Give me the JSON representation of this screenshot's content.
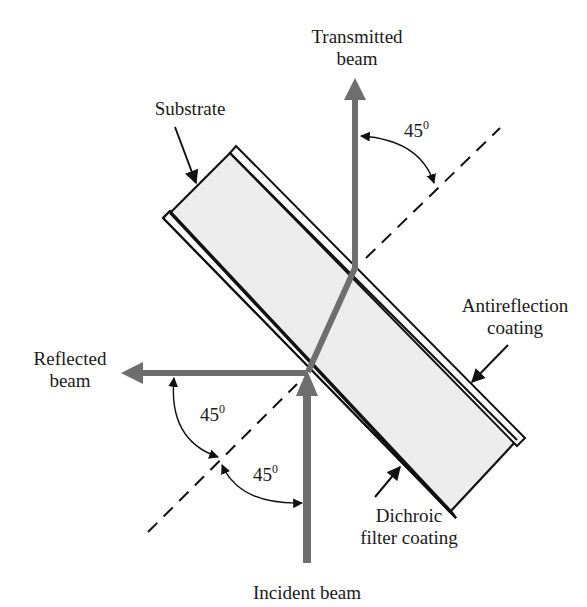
{
  "diagram": {
    "type": "optics-schematic",
    "colors": {
      "beam": "#6e6e6e",
      "substrate_fill": "#ececec",
      "outline": "#111111",
      "text": "#1a1a1a"
    },
    "labels": {
      "transmitted_line1": "Transmitted",
      "transmitted_line2": "beam",
      "substrate": "Substrate",
      "reflected_line1": "Reflected",
      "reflected_line2": "beam",
      "antireflection_line1": "Antireflection",
      "antireflection_line2": "coating",
      "dichroic_line1": "Dichroic",
      "dichroic_line2": "filter coating",
      "incident": "Incident beam"
    },
    "angles": {
      "transmitted_to_normal": "45",
      "reflected_to_normal": "45",
      "incident_to_normal": "45",
      "degree_mark": "0"
    }
  }
}
